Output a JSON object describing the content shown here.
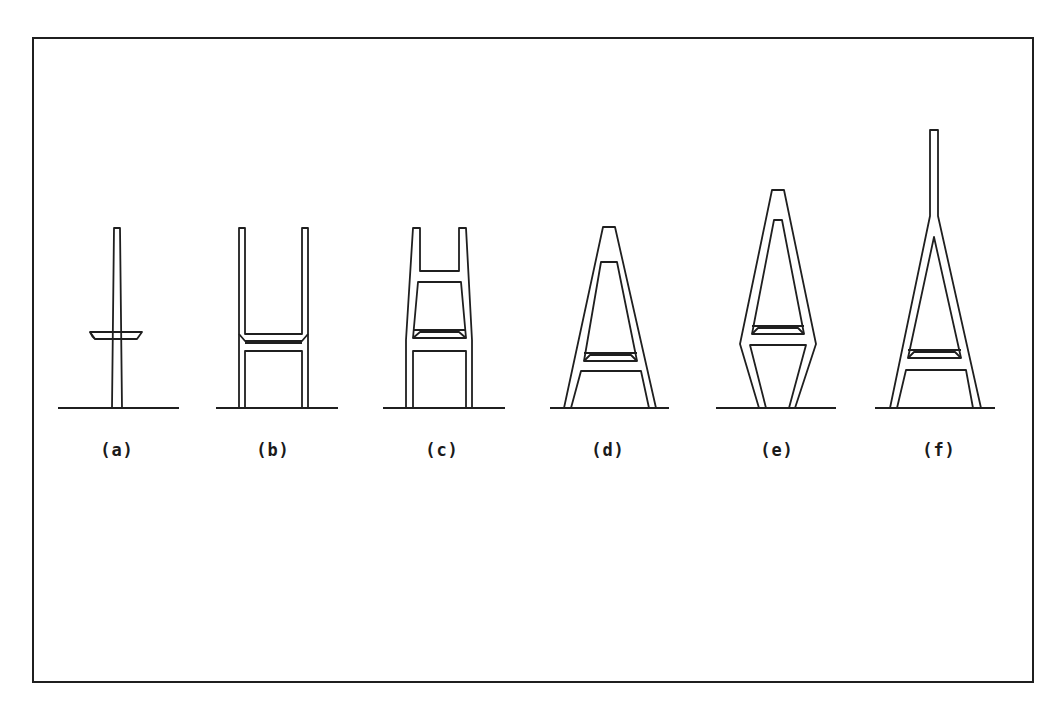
{
  "figure": {
    "frame": {
      "x": 33,
      "y": 38,
      "w": 1000,
      "h": 644
    },
    "stroke_color": "#1f1f1f",
    "towers": [
      {
        "id": "a",
        "label": "(a)",
        "label_x": 117,
        "label_y": 440,
        "ground": [
          58,
          408,
          179,
          408
        ],
        "paths": [
          "M112,408 L114,228 L120,228 L122,408",
          "M90,332 L142,332 L137,339 L95,339 Z",
          "M90,332 Q92,337 95,339"
        ],
        "lines": []
      },
      {
        "id": "b",
        "label": "(b)",
        "label_x": 273,
        "label_y": 440,
        "ground": [
          216,
          408,
          338,
          408
        ],
        "paths": [
          "M239,408 L239,228 L245,228 L245,334 L302,334 L302,228 L308,228 L308,408",
          "M245,408 L245,351 L302,351 L302,408",
          "M239,334 L245,341 L302,341 L308,334",
          "M245,343 L302,343"
        ],
        "lines": []
      },
      {
        "id": "c",
        "label": "(c)",
        "label_x": 442,
        "label_y": 440,
        "ground": [
          383,
          408,
          505,
          408
        ],
        "paths": [
          "M406,408 L406,340 L413,228 L420,228 L420,271 L459,271 L459,228 L466,228 L472,340 L472,408",
          "M413,408 L413,351 L466,351 L466,408",
          "M413,338 L418,282 L461,282 L466,338 Z",
          "M413,330 L466,330",
          "M413,338 L420,332 L459,332 L466,338"
        ],
        "lines": []
      },
      {
        "id": "d",
        "label": "(d)",
        "label_x": 608,
        "label_y": 440,
        "ground": [
          550,
          408,
          669,
          408
        ],
        "paths": [
          "M564,408 L603,227 L615,227 L656,408",
          "M571,408 L581,371 L641,371 L649,408",
          "M584,361 L601,262 L617,262 L637,361 Z",
          "M584,353 L637,353",
          "M584,361 L590,355 L631,355 L637,361"
        ],
        "lines": []
      },
      {
        "id": "e",
        "label": "(e)",
        "label_x": 777,
        "label_y": 440,
        "ground": [
          716,
          408,
          836,
          408
        ],
        "paths": [
          "M759,408 L740,344 L772,190 L784,190 L816,344 L795,408",
          "M766,408 L750,345 L806,345 L789,408",
          "M752,334 L774,220 L782,220 L804,334 Z",
          "M752,326 L804,326",
          "M752,334 L758,328 L798,328 L804,334"
        ],
        "lines": []
      },
      {
        "id": "f",
        "label": "(f)",
        "label_x": 939,
        "label_y": 440,
        "ground": [
          875,
          408,
          995,
          408
        ],
        "paths": [
          "M890,408 L930,216 L930,130 L938,130 L938,216 L981,408",
          "M897,408 L906,370 L966,370 L973,408",
          "M908,358 L934,237 L961,358 Z",
          "M908,350 L961,350",
          "M908,358 L914,352 L955,352 L961,358"
        ],
        "lines": []
      }
    ]
  }
}
